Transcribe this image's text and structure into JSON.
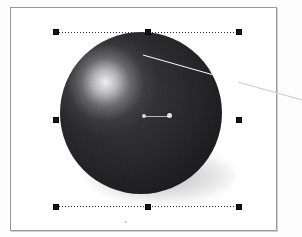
{
  "app": {
    "view_name": "canvas-artboard",
    "background_color": "#fdfdfd"
  },
  "document": {
    "name": "artboard",
    "page_color": "#ffffff",
    "border_color": "#9a9a9a",
    "left": 10,
    "top": 7,
    "width": 267,
    "height": 224
  },
  "object": {
    "type": "sphere",
    "label": "Sphere",
    "fill_color": "#242427",
    "highlight_color": "#ffffff",
    "shadow_color": "#5a5a5f",
    "center_x": 140,
    "center_y": 112,
    "radius": 81,
    "highlight_x": 105,
    "highlight_y": 82
  },
  "selection": {
    "label": "Selection bounding box",
    "stroke_color": "#2a2a2a",
    "stroke_style": "dotted",
    "handle_color": "#161616",
    "handle_count": 8,
    "left": 55,
    "top": 31,
    "width": 183,
    "height": 175,
    "handles": [
      {
        "id": "nw",
        "label": "top-left-resize-handle"
      },
      {
        "id": "n",
        "label": "top-center-resize-handle"
      },
      {
        "id": "ne",
        "label": "top-right-resize-handle"
      },
      {
        "id": "w",
        "label": "middle-left-resize-handle"
      },
      {
        "id": "e",
        "label": "middle-right-resize-handle"
      },
      {
        "id": "sw",
        "label": "bottom-left-resize-handle"
      },
      {
        "id": "s",
        "label": "bottom-center-resize-handle"
      },
      {
        "id": "se",
        "label": "bottom-right-resize-handle"
      }
    ]
  },
  "gradient_control": {
    "label": "Gradient center control",
    "line_color": "#b9b9bc",
    "start_x": 142,
    "start_y": 115,
    "end_x": 168,
    "end_y": 114
  },
  "guide_line": {
    "label": "Callout guide line",
    "color": "#ffffff",
    "stroke_width": 1,
    "x1": 143,
    "y1": 55,
    "x2": 302,
    "y2": 100
  }
}
